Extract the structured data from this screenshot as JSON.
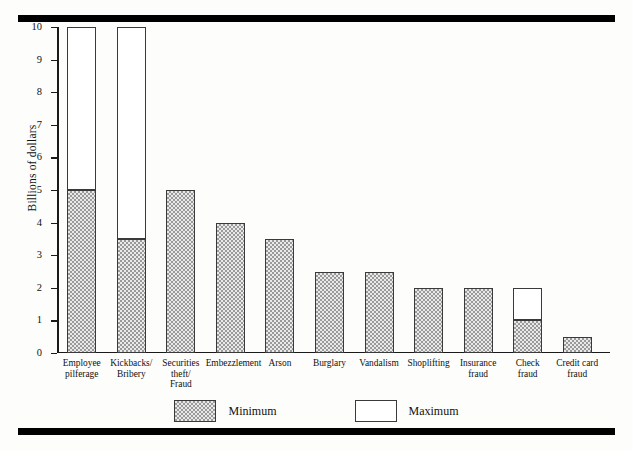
{
  "chart_data": {
    "type": "bar",
    "subtype": "stacked-range",
    "title": "",
    "xlabel": "",
    "ylabel": "Billions of dollars",
    "ylim": [
      0,
      10
    ],
    "ytick_labels": [
      "0",
      "1",
      "2",
      "3",
      "4",
      "5",
      "6",
      "7",
      "8",
      "9",
      "10"
    ],
    "yticks": [
      0,
      1,
      2,
      3,
      4,
      5,
      6,
      7,
      8,
      9,
      10
    ],
    "grid": false,
    "legend_position": "bottom-center",
    "categories": [
      "Employee\npilferage",
      "Kickbacks/\nBribery",
      "Securities\ntheft/\nFraud",
      "Embezzlement",
      "Arson",
      "Burglary",
      "Vandalism",
      "Shoplifting",
      "Insurance\nfraud",
      "Check\nfraud",
      "Credit card\nfraud"
    ],
    "series": [
      {
        "name": "Minimum",
        "fill": "stipple",
        "values": [
          5,
          3.5,
          5,
          4,
          3.5,
          2.5,
          2.5,
          2,
          2,
          1,
          0.5
        ]
      },
      {
        "name": "Maximum",
        "fill": "white",
        "values": [
          10,
          10,
          5,
          4,
          3.5,
          2.5,
          2.5,
          2,
          2,
          2,
          0.5
        ]
      }
    ]
  },
  "legend": {
    "items": [
      {
        "label": "Minimum",
        "swatch": "stipple"
      },
      {
        "label": "Maximum",
        "swatch": "white"
      }
    ]
  },
  "colors": {
    "rule": "#000000",
    "axis": "#1a1a1a",
    "bar_outline": "#3a3a3a",
    "stipple_fill": "#e9e9e9",
    "stipple_dot": "#9a9a9a",
    "white_fill": "#ffffff",
    "background": "#fdfdfb"
  }
}
